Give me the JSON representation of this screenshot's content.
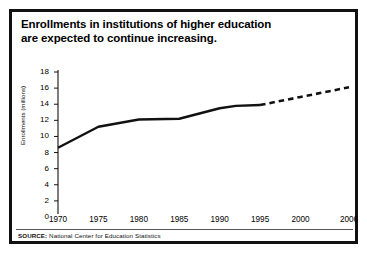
{
  "figure": {
    "title_line1": "Enrollments in institutions of higher education",
    "title_line2": "are expected to continue increasing.",
    "source_label": "SOURCE:",
    "source_text": "National Center for Education Statistics"
  },
  "chart_data": {
    "type": "line",
    "title": "Enrollments in institutions of higher education are expected to continue increasing.",
    "xlabel": "",
    "ylabel": "Enrollments (millions)",
    "xlim": [
      1970,
      2006
    ],
    "ylim": [
      0,
      18
    ],
    "ytick_labels": [
      "0",
      "2",
      "4",
      "6",
      "8",
      "10",
      "12",
      "14",
      "16",
      "18"
    ],
    "ytick_values": [
      0,
      2,
      4,
      6,
      8,
      10,
      12,
      14,
      16,
      18
    ],
    "xtick_labels": [
      "1970",
      "1975",
      "1980",
      "1985",
      "1990",
      "1995",
      "2000",
      "2006"
    ],
    "xtick_values": [
      1970,
      1975,
      1980,
      1985,
      1990,
      1995,
      2000,
      2006
    ],
    "grid": false,
    "legend": null,
    "series": [
      {
        "name": "Actual enrollments",
        "style": "solid",
        "color": "#111111",
        "x": [
          1970,
          1975,
          1980,
          1985,
          1990,
          1992,
          1995
        ],
        "values": [
          8.6,
          11.2,
          12.1,
          12.2,
          13.5,
          13.8,
          13.9
        ]
      },
      {
        "name": "Projected enrollments",
        "style": "dashed",
        "color": "#111111",
        "x": [
          1995,
          2000,
          2006
        ],
        "values": [
          13.9,
          14.9,
          16.1
        ]
      }
    ]
  }
}
